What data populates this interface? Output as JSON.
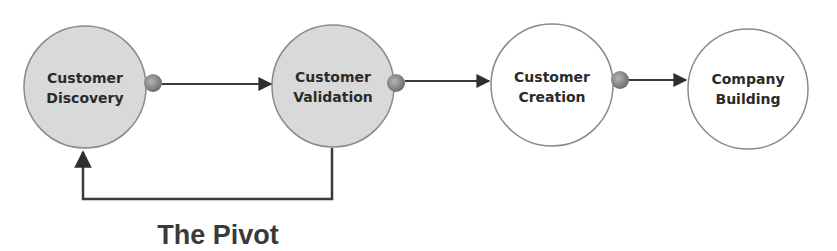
{
  "diagram": {
    "type": "process-flow",
    "nodes": [
      {
        "id": "customer-discovery",
        "line1": "Customer",
        "line2": "Discovery",
        "fill": "#d9d9d9"
      },
      {
        "id": "customer-validation",
        "line1": "Customer",
        "line2": "Validation",
        "fill": "#d9d9d9"
      },
      {
        "id": "customer-creation",
        "line1": "Customer",
        "line2": "Creation",
        "fill": "#ffffff"
      },
      {
        "id": "company-building",
        "line1": "Company",
        "line2": "Building",
        "fill": "#ffffff"
      }
    ],
    "edges": [
      {
        "from": "customer-discovery",
        "to": "customer-validation"
      },
      {
        "from": "customer-validation",
        "to": "customer-creation"
      },
      {
        "from": "customer-creation",
        "to": "company-building"
      },
      {
        "from": "customer-validation",
        "to": "customer-discovery",
        "label": "The Pivot"
      }
    ],
    "pivot_label": "The Pivot",
    "colors": {
      "stroke": "#3a3a3a",
      "circle_border": "#8a8a8a",
      "dot": "#8c8c8c",
      "active_fill": "#d9d9d9"
    }
  }
}
